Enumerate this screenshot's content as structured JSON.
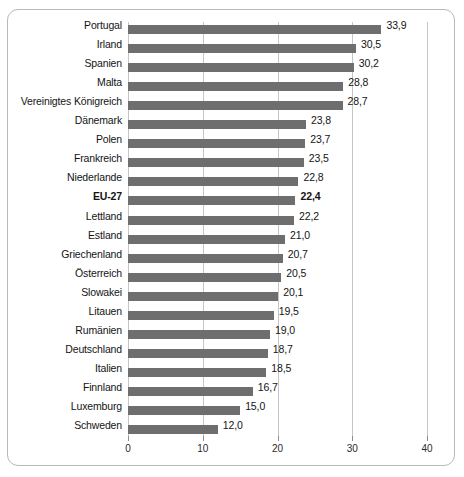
{
  "figure": {
    "title_fragment": "",
    "frame_border_color": "#b9b9b9",
    "bar_color": "#6e6e6e",
    "grid_color": "#c6c6c6"
  },
  "chart_data": {
    "type": "bar",
    "orientation": "horizontal",
    "title": "",
    "xlabel": "",
    "ylabel": "",
    "xlim": [
      0,
      40
    ],
    "xticks": [
      0,
      10,
      20,
      30,
      40
    ],
    "xtick_labels": [
      "0",
      "10",
      "20",
      "30",
      "40"
    ],
    "grid": true,
    "grid_axis": "x",
    "legend": false,
    "decimal_separator": ",",
    "categories": [
      "Portugal",
      "Irland",
      "Spanien",
      "Malta",
      "Vereinigtes Königreich",
      "Dänemark",
      "Polen",
      "Frankreich",
      "Niederlande",
      "EU-27",
      "Lettland",
      "Estland",
      "Griechenland",
      "Österreich",
      "Slowakei",
      "Litauen",
      "Rumänien",
      "Deutschland",
      "Italien",
      "Finnland",
      "Luxemburg",
      "Schweden"
    ],
    "values": [
      33.9,
      30.5,
      30.2,
      28.8,
      28.7,
      23.8,
      23.7,
      23.5,
      22.8,
      22.4,
      22.2,
      21.0,
      20.7,
      20.5,
      20.1,
      19.5,
      19.0,
      18.7,
      18.5,
      16.7,
      15.0,
      12.0
    ],
    "value_labels": [
      "33,9",
      "30,5",
      "30,2",
      "28,8",
      "28,7",
      "23,8",
      "23,7",
      "23,5",
      "22,8",
      "22,4",
      "22,2",
      "21,0",
      "20,7",
      "20,5",
      "20,1",
      "19,5",
      "19,0",
      "18,7",
      "18,5",
      "16,7",
      "15,0",
      "12,0"
    ],
    "emphasized_categories": [
      "EU-27"
    ]
  }
}
